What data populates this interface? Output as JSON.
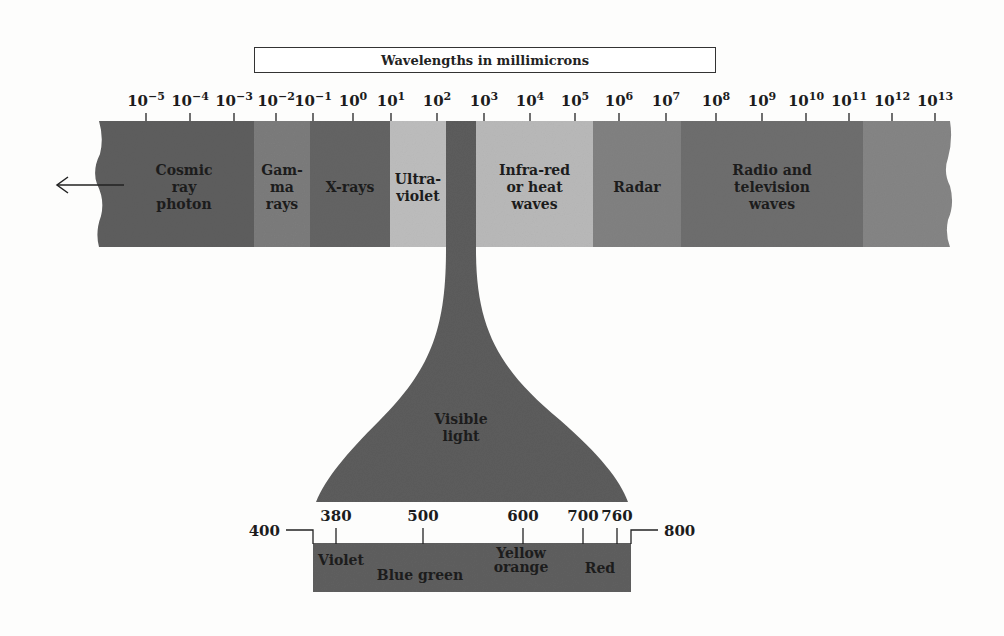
{
  "title": "Wavelengths in millimicrons",
  "scale": {
    "ticks": [
      {
        "base": "10",
        "exp": "−5"
      },
      {
        "base": "10",
        "exp": "−4"
      },
      {
        "base": "10",
        "exp": "−3"
      },
      {
        "base": "10",
        "exp": "−2"
      },
      {
        "base": "10",
        "exp": "−1"
      },
      {
        "base": "10",
        "exp": "0"
      },
      {
        "base": "10",
        "exp": "1"
      },
      {
        "base": "10",
        "exp": "2"
      },
      {
        "base": "10",
        "exp": "3"
      },
      {
        "base": "10",
        "exp": "4"
      },
      {
        "base": "10",
        "exp": "5"
      },
      {
        "base": "10",
        "exp": "6"
      },
      {
        "base": "10",
        "exp": "7"
      },
      {
        "base": "10",
        "exp": "8"
      },
      {
        "base": "10",
        "exp": "9"
      },
      {
        "base": "10",
        "exp": "10"
      },
      {
        "base": "10",
        "exp": "11"
      },
      {
        "base": "10",
        "exp": "12"
      },
      {
        "base": "10",
        "exp": "13"
      }
    ]
  },
  "bands": [
    {
      "name": "cosmic-ray-photon",
      "lines": [
        "Cosmic",
        "ray",
        "photon"
      ],
      "color": "#5e5e5e"
    },
    {
      "name": "gamma-rays",
      "lines": [
        "Gam-",
        "ma",
        "rays"
      ],
      "color": "#7c7c7c"
    },
    {
      "name": "x-rays",
      "lines": [
        "X-rays"
      ],
      "color": "#646464"
    },
    {
      "name": "ultraviolet",
      "lines": [
        "Ultra-",
        "violet"
      ],
      "color": "#bdbdbd"
    },
    {
      "name": "visible",
      "lines": [],
      "color": "#5a5a5a"
    },
    {
      "name": "infrared",
      "lines": [
        "Infra-red",
        "or heat",
        "waves"
      ],
      "color": "#b9b9b9"
    },
    {
      "name": "radar",
      "lines": [
        "Radar"
      ],
      "color": "#818181"
    },
    {
      "name": "radio-television",
      "lines": [
        "Radio and",
        "television",
        "waves"
      ],
      "color": "#6e6e6e"
    },
    {
      "name": "long-waves",
      "lines": [],
      "color": "#858585"
    }
  ],
  "arrow": {
    "direction": "left"
  },
  "visible_light": {
    "label_lines": [
      "Visible",
      "light"
    ],
    "color": "#5c5c5c"
  },
  "visible_scale": {
    "left_end": "400",
    "right_end": "800",
    "ticks": [
      "380",
      "500",
      "600",
      "700",
      "760"
    ],
    "colors": [
      {
        "lines": [
          "Violet"
        ]
      },
      {
        "lines": [
          "Blue green"
        ]
      },
      {
        "lines": [
          "Yellow",
          "orange"
        ]
      },
      {
        "lines": [
          "Red"
        ]
      }
    ],
    "color": "#5f5f5f"
  }
}
